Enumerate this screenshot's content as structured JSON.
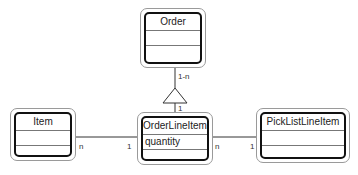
{
  "diagram": {
    "type": "UML class diagram",
    "classes": [
      {
        "id": "order",
        "name": "Order",
        "attributes": "",
        "operations": ""
      },
      {
        "id": "item",
        "name": "Item",
        "attributes": "",
        "operations": ""
      },
      {
        "id": "order_line_item",
        "name": "OrderLineItem",
        "attributes": "quantity",
        "operations": ""
      },
      {
        "id": "pick_list_line_item",
        "name": "PickListLineItem",
        "attributes": "",
        "operations": ""
      }
    ],
    "relationships": [
      {
        "from": "order",
        "to": "order_line_item",
        "kind": "generalization/aggregation",
        "from_mult": "1-n",
        "to_mult": "1"
      },
      {
        "from": "item",
        "to": "order_line_item",
        "kind": "association",
        "from_mult": "n",
        "to_mult": "1"
      },
      {
        "from": "order_line_item",
        "to": "pick_list_line_item",
        "kind": "association",
        "from_mult": "n",
        "to_mult": "1"
      }
    ],
    "multiplicities": {
      "order_side": "1-n",
      "oli_top": "1",
      "item_side": "n",
      "oli_left": "1",
      "oli_right": "n",
      "plli_left": "1"
    }
  }
}
